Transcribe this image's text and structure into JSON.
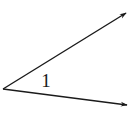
{
  "diagram": {
    "type": "angle",
    "label": "1",
    "stroke_color": "#1a1a1a",
    "background": "#ffffff",
    "vertex": {
      "x": 3,
      "y": 89
    },
    "rays": [
      {
        "name": "upper-ray",
        "end": {
          "x": 126,
          "y": 13
        }
      },
      {
        "name": "lower-ray",
        "end": {
          "x": 127,
          "y": 105
        }
      }
    ],
    "label_position": {
      "x": 46,
      "y": 87
    }
  }
}
